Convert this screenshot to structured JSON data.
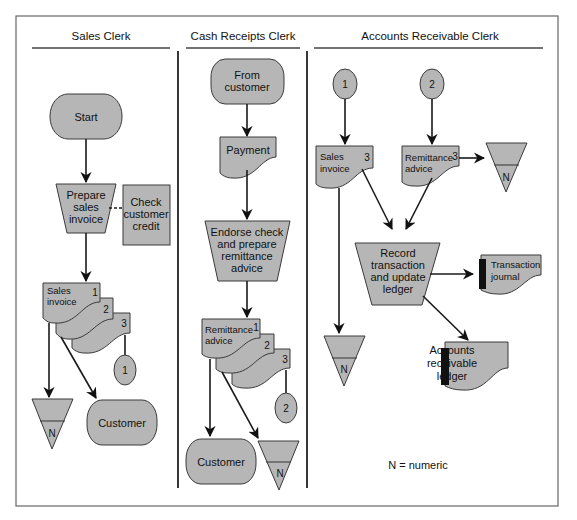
{
  "lanes": [
    {
      "title": "Sales Clerk"
    },
    {
      "title": "Cash Receipts Clerk"
    },
    {
      "title": "Accounts Receivable Clerk"
    }
  ],
  "sales_clerk": {
    "start": "Start",
    "process": [
      "Prepare",
      "sales",
      "invoice"
    ],
    "check": [
      "Check",
      "customer",
      "credit"
    ],
    "document": [
      "Sales",
      "invoice"
    ],
    "copies": [
      "1",
      "2",
      "3"
    ],
    "connector": "1",
    "file": "N",
    "terminal": "Customer"
  },
  "cash_receipts_clerk": {
    "from": [
      "From",
      "customer"
    ],
    "payment": "Payment",
    "process": [
      "Endorse check",
      "and prepare",
      "remittance",
      "advice"
    ],
    "document": [
      "Remittance",
      "advice"
    ],
    "copies": [
      "1",
      "2",
      "3"
    ],
    "connector": "2",
    "terminal": "Customer",
    "file": "N"
  },
  "ar_clerk": {
    "connector_1": "1",
    "connector_2": "2",
    "sales_invoice": [
      "Sales",
      "invoice"
    ],
    "sales_invoice_copy": "3",
    "remittance_advice": [
      "Remittance",
      "advice"
    ],
    "remittance_copy": "3",
    "file_top": "N",
    "file_bottom": "N",
    "process": [
      "Record",
      "transaction",
      "and update",
      "ledger"
    ],
    "journal": [
      "Transaction",
      "journal"
    ],
    "ledger": [
      "Accounts",
      "receivable",
      "ledger"
    ],
    "legend": "N = numeric"
  },
  "colors": {
    "shape_fill": "#b6b6b6",
    "line": "#1a1a1a",
    "background": "#ffffff"
  }
}
